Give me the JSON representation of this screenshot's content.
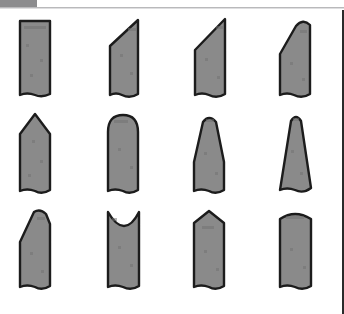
{
  "figure": {
    "background_color": "#ffffff",
    "shape_fill_color": "#8a8a8a",
    "shape_outline_color": "#1c1c1c",
    "rows": 3,
    "columns": 4,
    "total_shapes": 12
  },
  "header": {
    "tab_label": "",
    "tab_color": "#8c8c8e",
    "rule_color": "#b9b9bb"
  },
  "shapes": [
    {
      "index": 1,
      "row": 1,
      "column": 1,
      "name": "flat-top-rectangle",
      "top_profile": "flat",
      "bottom_profile": "straight",
      "label": ""
    },
    {
      "index": 2,
      "row": 1,
      "column": 2,
      "name": "left-diagonal-bevel",
      "top_profile": "diagonal-rising-right",
      "bottom_profile": "wavy",
      "label": ""
    },
    {
      "index": 3,
      "row": 1,
      "column": 3,
      "name": "steep-diagonal-bevel",
      "top_profile": "diagonal-rising-right-steep",
      "bottom_profile": "wavy",
      "label": ""
    },
    {
      "index": 4,
      "row": 1,
      "column": 4,
      "name": "rounded-diagonal-bevel",
      "top_profile": "diagonal-with-rounded-corner",
      "bottom_profile": "wavy",
      "label": ""
    },
    {
      "index": 5,
      "row": 2,
      "column": 1,
      "name": "pointed-gable-top",
      "top_profile": "sharp-peak",
      "bottom_profile": "wavy",
      "label": ""
    },
    {
      "index": 6,
      "row": 2,
      "column": 2,
      "name": "rounded-dome-top",
      "top_profile": "semicircular-dome",
      "bottom_profile": "wavy",
      "label": ""
    },
    {
      "index": 7,
      "row": 2,
      "column": 3,
      "name": "tapered-bullet-top",
      "top_profile": "tapered-rounded",
      "bottom_profile": "wavy",
      "label": ""
    },
    {
      "index": 8,
      "row": 2,
      "column": 4,
      "name": "narrow-tapered-spire",
      "top_profile": "narrow-tapered-rounded",
      "bottom_profile": "wavy",
      "label": ""
    },
    {
      "index": 9,
      "row": 3,
      "column": 1,
      "name": "asymmetric-chisel-top",
      "top_profile": "asymmetric-angled",
      "bottom_profile": "wavy",
      "label": ""
    },
    {
      "index": 10,
      "row": 3,
      "column": 2,
      "name": "concave-notch-top",
      "top_profile": "concave",
      "bottom_profile": "wavy",
      "label": ""
    },
    {
      "index": 11,
      "row": 3,
      "column": 3,
      "name": "shallow-gable-top",
      "top_profile": "shallow-peak",
      "bottom_profile": "wavy",
      "label": ""
    },
    {
      "index": 12,
      "row": 3,
      "column": 4,
      "name": "convex-arched-top",
      "top_profile": "shallow-convex-arch",
      "bottom_profile": "wavy",
      "label": ""
    }
  ]
}
